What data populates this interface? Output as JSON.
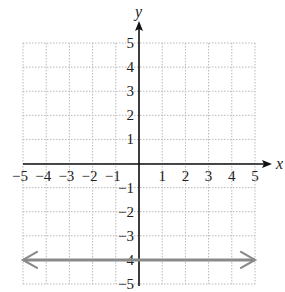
{
  "chart_data": {
    "type": "line",
    "title": "",
    "xlabel": "x",
    "ylabel": "y",
    "xlim": [
      -5,
      5
    ],
    "ylim": [
      -5,
      5
    ],
    "grid": true,
    "x_ticks": [
      -5,
      -4,
      -3,
      -2,
      -1,
      1,
      2,
      3,
      4,
      5
    ],
    "y_ticks": [
      5,
      4,
      3,
      2,
      1,
      -1,
      -2,
      -3,
      -4,
      -5
    ],
    "x_tick_labels": [
      "−5",
      "−4",
      "−3",
      "−2",
      "−1",
      "1",
      "2",
      "3",
      "4",
      "5"
    ],
    "y_tick_labels": [
      "5",
      "4",
      "3",
      "2",
      "1",
      "−1",
      "−2",
      "−3",
      "−4",
      "−5"
    ],
    "series": [
      {
        "name": "y = -4",
        "equation": "y = -4",
        "x": [
          -5,
          5
        ],
        "y": [
          -4,
          -4
        ],
        "arrows_both_ends": true,
        "color": "#8a8a8a"
      }
    ],
    "legend": null
  },
  "colors": {
    "axis": "#111111",
    "grid": "#b8b8b8",
    "line": "#8a8a8a"
  }
}
